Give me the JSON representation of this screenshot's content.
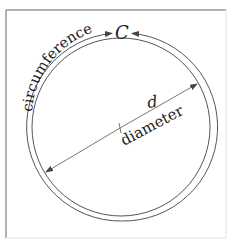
{
  "diagram": {
    "title_symbol": "C",
    "circumference_label": "circumference",
    "diameter_symbol": "d",
    "diameter_label": "diameter",
    "colors": {
      "line": "#555555",
      "text": "#222222",
      "frame": "#9a9a9a",
      "background": "#ffffff"
    }
  }
}
